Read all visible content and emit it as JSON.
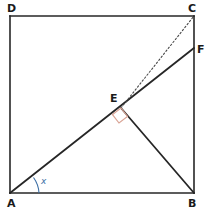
{
  "figure": {
    "background_color": "#ffffff",
    "stroke_color": "#262626",
    "accent_blue": "#3d6fa5",
    "right_angle_color": "#d9a394",
    "dotted_color": "#4a4a4a"
  },
  "points": [
    {
      "name": "A",
      "label": "A",
      "x": 10,
      "y": 193,
      "label_x": 7,
      "label_y": 206
    },
    {
      "name": "B",
      "label": "B",
      "x": 194,
      "y": 193,
      "label_x": 190,
      "label_y": 206
    },
    {
      "name": "C",
      "label": "C",
      "x": 194,
      "y": 16,
      "label_x": 190,
      "label_y": 11
    },
    {
      "name": "D",
      "label": "D",
      "x": 10,
      "y": 16,
      "label_x": 7,
      "label_y": 11
    },
    {
      "name": "E",
      "label": "E",
      "x": 121,
      "y": 108,
      "label_x": 113,
      "label_y": 101
    },
    {
      "name": "F",
      "label": "F",
      "x": 194,
      "y": 48,
      "label_x": 198,
      "label_y": 53
    }
  ],
  "segments": [
    {
      "name": "side-AB",
      "from": "A",
      "to": "B",
      "style": "solid"
    },
    {
      "name": "side-BC",
      "from": "B",
      "to": "C",
      "style": "solid"
    },
    {
      "name": "side-CD",
      "from": "C",
      "to": "D",
      "style": "solid"
    },
    {
      "name": "side-DA",
      "from": "D",
      "to": "A",
      "style": "solid"
    },
    {
      "name": "line-AF",
      "from": "A",
      "to": "F",
      "style": "solid"
    },
    {
      "name": "line-EB",
      "from": "E",
      "to": "B",
      "style": "solid"
    },
    {
      "name": "line-EC",
      "from": "E",
      "to": "C",
      "style": "dotted"
    }
  ],
  "markers": {
    "right_angle": {
      "name": "right-angle-at-E",
      "vertex": "E",
      "size": 9,
      "color": "#d9a394",
      "path": "M 121,108 L 113,114 L 119,122 L 127,116 Z"
    },
    "angle_x": {
      "name": "angle-x-at-A",
      "vertex": "A",
      "label": "x",
      "color": "#3d6fa5",
      "label_x": 42,
      "label_y": 183,
      "arc_path": "M 37,193 A 27,27 0 0 0 33,178"
    }
  }
}
